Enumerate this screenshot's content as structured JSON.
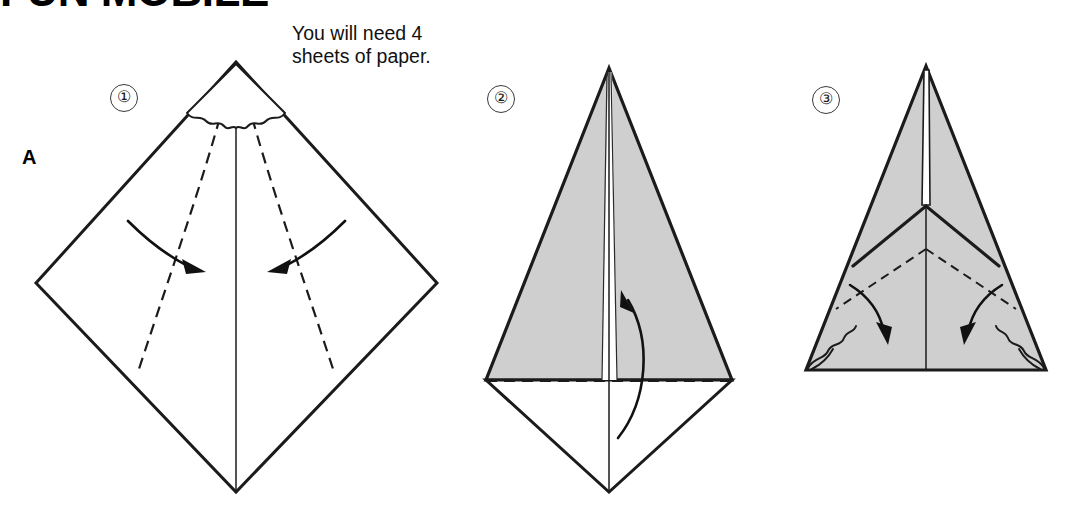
{
  "page": {
    "title": "FUN MOBILE",
    "section_letter": "A",
    "background_color": "#ffffff",
    "ink_color": "#1b1b1b",
    "paper_gray": "#cfcfcf"
  },
  "note": {
    "line1": "You will need 4",
    "line2": "sheets of paper."
  },
  "steps": [
    {
      "number": "①",
      "id": "step-1",
      "shape": "square-diamond",
      "fill": "white",
      "description": "Square sheet rotated 45 degrees; dashed valley folds run from top apex down to lower edges; scalloped pleat detail under the apex; two curved arrows fold left and right edges toward the vertical centre line."
    },
    {
      "number": "②",
      "id": "step-2",
      "shape": "kite",
      "fill": "gray-upper-white-lower",
      "description": "Kite form: shaded upper triangle split by a centre seam, white lower triangle; a horizontal dashed fold line crosses the widest points; a curved arrow sweeps upward to fold the bottom point up."
    },
    {
      "number": "③",
      "id": "step-3",
      "shape": "triangle",
      "fill": "gray",
      "description": "Shaded triangle with a centre seam ending in a V chevron; dashed folds at each lower corner; two curved arrows fold the lower corner flaps down and inward."
    }
  ],
  "icons": {
    "step_marker": "circled-number-icon",
    "fold_arrow": "curved-arrow-icon",
    "valley_fold": "dashed-line-icon",
    "pleat": "scallop-icon"
  }
}
